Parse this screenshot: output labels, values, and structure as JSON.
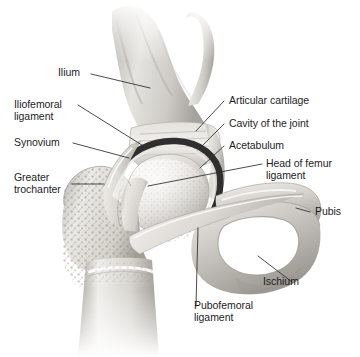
{
  "figure": {
    "background_color": "#ffffff",
    "label_color": "#1d1d1f",
    "leader_line_color": "#2b2b2b",
    "bone_light": "#f2f1ef",
    "bone_mid": "#cfcdc9",
    "bone_dark": "#8e8b86",
    "cartilage_dark": "#2f2f2f"
  },
  "labels": {
    "ilium": "Ilium",
    "iliofemoral_ligament_line1": "Iliofemoral",
    "iliofemoral_ligament_line2": "ligament",
    "synovium": "Synovium",
    "greater_trochanter_line1": "Greater",
    "greater_trochanter_line2": "trochanter",
    "articular_cartilage": "Articular cartilage",
    "cavity_of_the_joint": "Cavity of the joint",
    "acetabulum": "Acetabulum",
    "head_of_femur_ligament_line1": "Head of femur",
    "head_of_femur_ligament_line2": "ligament",
    "pubis": "Pubis",
    "ischium": "Ischium",
    "pubofemoral_ligament_line1": "Pubofemoral",
    "pubofemoral_ligament_line2": "ligament"
  }
}
